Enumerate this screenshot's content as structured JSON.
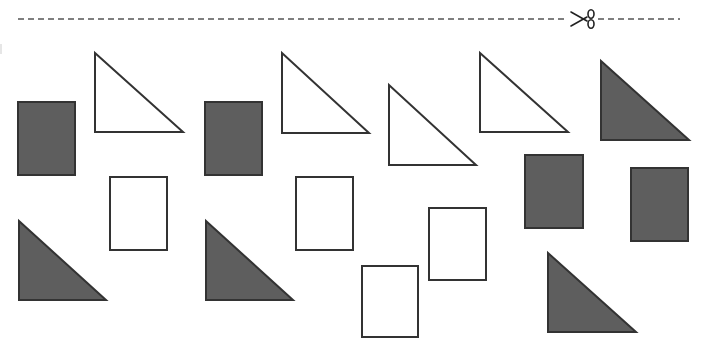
{
  "colors": {
    "background": "#ffffff",
    "stroke": "#333333",
    "filled": "#5e5e5e",
    "empty": "#ffffff",
    "cut_line": "#555555"
  },
  "cut_line": {
    "x1": 18,
    "x2": 680,
    "y": 19,
    "dash": "6 4",
    "icon": "scissors-icon",
    "icon_x": 570,
    "icon_y": 9
  },
  "shapes": [
    {
      "id": "rect-1",
      "type": "rectangle",
      "fill": "filled",
      "x": 18,
      "y": 102,
      "w": 57,
      "h": 73
    },
    {
      "id": "tri-1",
      "type": "triangle",
      "fill": "empty",
      "points": "95,53 95,132 183,132"
    },
    {
      "id": "rect-2",
      "type": "rectangle",
      "fill": "empty",
      "x": 110,
      "y": 177,
      "w": 57,
      "h": 73
    },
    {
      "id": "tri-2",
      "type": "triangle",
      "fill": "filled",
      "points": "19,221 19,300 106,300"
    },
    {
      "id": "rect-3",
      "type": "rectangle",
      "fill": "filled",
      "x": 205,
      "y": 102,
      "w": 57,
      "h": 73
    },
    {
      "id": "tri-3",
      "type": "triangle",
      "fill": "empty",
      "points": "282,53 282,133 369,133"
    },
    {
      "id": "rect-4",
      "type": "rectangle",
      "fill": "empty",
      "x": 296,
      "y": 177,
      "w": 57,
      "h": 73
    },
    {
      "id": "tri-4",
      "type": "triangle",
      "fill": "filled",
      "points": "206,221 206,300 293,300"
    },
    {
      "id": "tri-5",
      "type": "triangle",
      "fill": "empty",
      "points": "389,85 389,165 476,165"
    },
    {
      "id": "rect-5",
      "type": "rectangle",
      "fill": "empty",
      "x": 362,
      "y": 266,
      "w": 56,
      "h": 71
    },
    {
      "id": "rect-6",
      "type": "rectangle",
      "fill": "empty",
      "x": 429,
      "y": 208,
      "w": 57,
      "h": 72
    },
    {
      "id": "tri-6",
      "type": "triangle",
      "fill": "empty",
      "points": "480,53 480,132 568,132"
    },
    {
      "id": "tri-7",
      "type": "triangle",
      "fill": "filled",
      "points": "601,61 601,140 689,140"
    },
    {
      "id": "rect-7",
      "type": "rectangle",
      "fill": "filled",
      "x": 525,
      "y": 155,
      "w": 58,
      "h": 73
    },
    {
      "id": "rect-8",
      "type": "rectangle",
      "fill": "filled",
      "x": 631,
      "y": 168,
      "w": 57,
      "h": 73
    },
    {
      "id": "tri-8",
      "type": "triangle",
      "fill": "filled",
      "points": "548,253 548,332 636,332"
    }
  ]
}
